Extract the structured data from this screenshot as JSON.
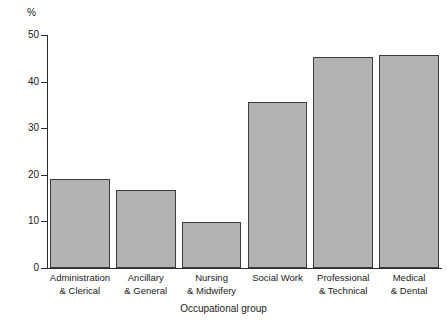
{
  "chart_data": {
    "type": "bar",
    "title": "",
    "xlabel": "Occupational group",
    "ylabel": "%",
    "ylim": [
      0,
      50
    ],
    "ytick_labels": [
      "0",
      "10",
      "20",
      "30",
      "40",
      "50"
    ],
    "ytick_values": [
      0,
      10,
      20,
      30,
      40,
      50
    ],
    "grid": false,
    "legend": false,
    "categories": [
      "Administration & Clerical",
      "Ancillary & General",
      "Nursing & Midwifery",
      "Social Work",
      "Professional & Technical",
      "Medical & Dental"
    ],
    "category_lines": [
      [
        "Administration",
        "& Clerical"
      ],
      [
        "Ancillary",
        "& General"
      ],
      [
        "Nursing",
        "& Midwifery"
      ],
      [
        "Social Work",
        ""
      ],
      [
        "Professional",
        "& Technical"
      ],
      [
        "Medical",
        "& Dental"
      ]
    ],
    "values": [
      19.2,
      16.7,
      9.8,
      35.6,
      45.2,
      45.8
    ],
    "bar_color": "#b3b3b3",
    "bar_border_color": "#3d3d3d",
    "axis_color": "#2b2b2b"
  }
}
